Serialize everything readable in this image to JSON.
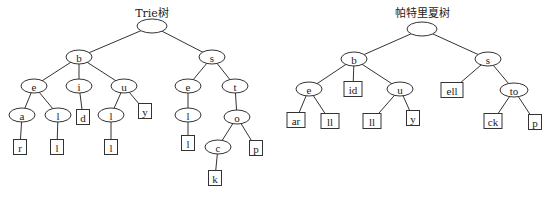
{
  "diagrams": [
    {
      "id": "trie",
      "title": "Trie树",
      "nodes": [
        {
          "id": "root",
          "label": "",
          "shape": "ellipse"
        },
        {
          "id": "b",
          "label": "b",
          "shape": "ellipse",
          "parent": "root"
        },
        {
          "id": "s",
          "label": "s",
          "shape": "ellipse",
          "parent": "root"
        },
        {
          "id": "be",
          "label": "e",
          "shape": "ellipse",
          "parent": "b"
        },
        {
          "id": "bi",
          "label": "i",
          "shape": "ellipse",
          "parent": "b"
        },
        {
          "id": "bu",
          "label": "u",
          "shape": "ellipse",
          "parent": "b"
        },
        {
          "id": "bea",
          "label": "a",
          "shape": "ellipse",
          "parent": "be"
        },
        {
          "id": "bel",
          "label": "l",
          "shape": "ellipse",
          "parent": "be"
        },
        {
          "id": "bid",
          "label": "d",
          "shape": "rect",
          "parent": "bi"
        },
        {
          "id": "bul",
          "label": "l",
          "shape": "ellipse",
          "parent": "bu"
        },
        {
          "id": "buy",
          "label": "y",
          "shape": "rect",
          "parent": "bu"
        },
        {
          "id": "bear",
          "label": "r",
          "shape": "rect",
          "parent": "bea"
        },
        {
          "id": "bell",
          "label": "l",
          "shape": "rect",
          "parent": "bel"
        },
        {
          "id": "bull",
          "label": "l",
          "shape": "rect",
          "parent": "bul"
        },
        {
          "id": "se",
          "label": "e",
          "shape": "ellipse",
          "parent": "s"
        },
        {
          "id": "st",
          "label": "t",
          "shape": "ellipse",
          "parent": "s"
        },
        {
          "id": "sel",
          "label": "l",
          "shape": "ellipse",
          "parent": "se"
        },
        {
          "id": "sto",
          "label": "o",
          "shape": "ellipse",
          "parent": "st"
        },
        {
          "id": "sell",
          "label": "l",
          "shape": "rect",
          "parent": "sel"
        },
        {
          "id": "stoc",
          "label": "c",
          "shape": "ellipse",
          "parent": "sto"
        },
        {
          "id": "stop",
          "label": "p",
          "shape": "rect",
          "parent": "sto"
        },
        {
          "id": "stock",
          "label": "k",
          "shape": "rect",
          "parent": "stoc"
        }
      ]
    },
    {
      "id": "patricia",
      "title": "帕特里夏树",
      "nodes": [
        {
          "id": "root",
          "label": "",
          "shape": "ellipse"
        },
        {
          "id": "b",
          "label": "b",
          "shape": "ellipse",
          "parent": "root"
        },
        {
          "id": "s",
          "label": "s",
          "shape": "ellipse",
          "parent": "root"
        },
        {
          "id": "be",
          "label": "e",
          "shape": "ellipse",
          "parent": "b"
        },
        {
          "id": "bid",
          "label": "id",
          "shape": "rect",
          "parent": "b"
        },
        {
          "id": "bu",
          "label": "u",
          "shape": "ellipse",
          "parent": "b"
        },
        {
          "id": "bear",
          "label": "ar",
          "shape": "rect",
          "parent": "be"
        },
        {
          "id": "bell",
          "label": "ll",
          "shape": "rect",
          "parent": "be"
        },
        {
          "id": "bull",
          "label": "ll",
          "shape": "rect",
          "parent": "bu"
        },
        {
          "id": "buy",
          "label": "y",
          "shape": "rect",
          "parent": "bu"
        },
        {
          "id": "sell",
          "label": "ell",
          "shape": "rect",
          "parent": "s"
        },
        {
          "id": "sto",
          "label": "to",
          "shape": "ellipse",
          "parent": "s"
        },
        {
          "id": "stock",
          "label": "ck",
          "shape": "rect",
          "parent": "sto"
        },
        {
          "id": "stop",
          "label": "p",
          "shape": "rect",
          "parent": "sto"
        }
      ]
    }
  ]
}
